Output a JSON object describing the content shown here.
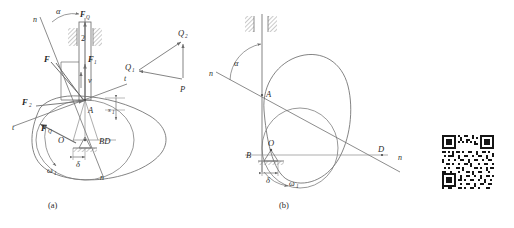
{
  "figure": {
    "type": "engineering-diagram",
    "background_color": "#ffffff",
    "line_color": "#6e6e6e",
    "label_color": "#2b2b2b",
    "captions": {
      "part_a": "(a)",
      "part_b": "(b)"
    }
  },
  "diagram_a": {
    "name": "cam-with-flat-follower-force-analysis",
    "labels": {
      "normal_line_top": "n",
      "normal_line_bottom": "n",
      "pressure_angle": "α",
      "force_resist": "F",
      "force_Q_top": "F",
      "force_Q_top_sub": "Q",
      "force_1": "F",
      "force_1_sub": "1",
      "force_2": "F",
      "force_2_sub": "2",
      "force_Q_cam": "F",
      "force_Q_cam_sub": "Q",
      "velocity": "v",
      "tangent_upper": "t",
      "tangent_lower": "t",
      "contact_point": "A",
      "cam_center": "O",
      "segment_BD": "BD",
      "offset": "δ",
      "angular_velocity": "ω",
      "angular_velocity_sub": "1",
      "follower_number": "2",
      "displacement": "s",
      "displacement_sub": "1"
    }
  },
  "force_triangle": {
    "name": "force-vector-triangle",
    "vertices": [
      {
        "label": "Q",
        "sub": "1",
        "position": "left"
      },
      {
        "label": "Q",
        "sub": "2",
        "position": "top-right"
      },
      {
        "label": "P",
        "sub": "",
        "position": "bottom-right"
      }
    ]
  },
  "diagram_b": {
    "name": "cam-with-roller-follower-instant-center",
    "labels": {
      "normal_line_left": "n",
      "normal_line_right": "n",
      "pressure_angle": "α",
      "contact_point": "A",
      "point_B": "B",
      "cam_center": "O",
      "instant_center": "D",
      "offset": "δ",
      "angular_velocity": "ω",
      "angular_velocity_sub": "1"
    }
  },
  "qr_code": {
    "name": "qr-code",
    "present": true,
    "description": "scanned QR code watermark, bottom-right corner"
  }
}
